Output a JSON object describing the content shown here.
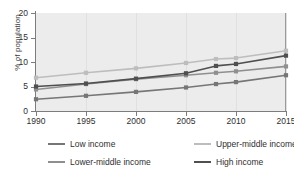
{
  "chart_data": {
    "type": "line",
    "title": "",
    "subtitle": "",
    "xlabel": "",
    "ylabel": "% of population",
    "xlim": [
      1990,
      2015
    ],
    "ylim": [
      0,
      20
    ],
    "yticks": [
      0,
      5,
      10,
      15,
      20
    ],
    "xticks": [
      1990,
      1995,
      2000,
      2005,
      2010,
      2015
    ],
    "ytick_labels": [
      "0",
      "5",
      "10",
      "15",
      "20"
    ],
    "xtick_labels": [
      "1990",
      "1995",
      "2000",
      "2005",
      "2010",
      "2015"
    ],
    "grid": "vertical-only",
    "legend_position": "bottom",
    "plot_background": "#ececec",
    "page_background": "#ffffff",
    "axis_color": "#7d7d7d",
    "x": [
      1990,
      1995,
      2000,
      2005,
      2008,
      2010,
      2015
    ],
    "series": [
      {
        "name": "Low income",
        "color": "#767676",
        "marker": "square",
        "values": [
          2.4,
          3.1,
          3.9,
          4.8,
          5.5,
          5.9,
          7.3
        ]
      },
      {
        "name": "Upper-middle income",
        "color": "#bdbdbd",
        "marker": "square",
        "values": [
          6.8,
          7.8,
          8.7,
          9.8,
          10.6,
          10.8,
          12.3
        ]
      },
      {
        "name": "Lower-middle income",
        "color": "#8f8f8f",
        "marker": "square",
        "values": [
          4.4,
          5.5,
          6.5,
          7.3,
          7.8,
          8.1,
          9.1
        ]
      },
      {
        "name": "High income",
        "color": "#4f4f4f",
        "marker": "square",
        "values": [
          5.0,
          5.6,
          6.6,
          7.7,
          9.2,
          9.6,
          11.3
        ]
      }
    ],
    "legend": [
      {
        "label": "Low income",
        "color": "#767676"
      },
      {
        "label": "Upper-middle income",
        "color": "#bdbdbd"
      },
      {
        "label": "Lower-middle income",
        "color": "#8f8f8f"
      },
      {
        "label": "High income",
        "color": "#4f4f4f"
      }
    ]
  }
}
